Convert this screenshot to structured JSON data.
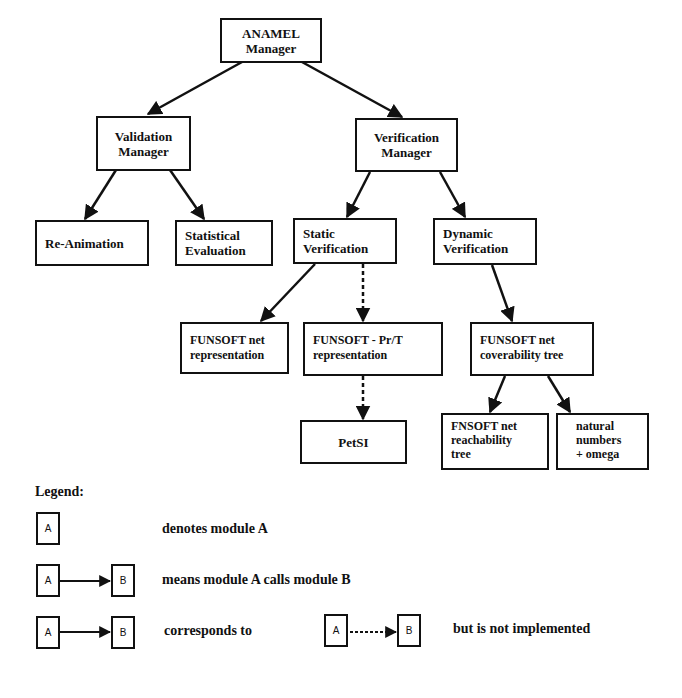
{
  "diagram": {
    "nodes": [
      {
        "id": "anamel_manager",
        "lines": [
          "ANAMEL",
          "Manager"
        ]
      },
      {
        "id": "validation_manager",
        "lines": [
          "Validation",
          "Manager"
        ]
      },
      {
        "id": "verification_manager",
        "lines": [
          "Verification",
          "Manager"
        ]
      },
      {
        "id": "re_animation",
        "lines": [
          "Re-Animation"
        ]
      },
      {
        "id": "statistical_evaluation",
        "lines": [
          "Statistical",
          "Evaluation"
        ]
      },
      {
        "id": "static_verification",
        "lines": [
          "Static",
          "Verification"
        ]
      },
      {
        "id": "dynamic_verification",
        "lines": [
          "Dynamic",
          "Verification"
        ]
      },
      {
        "id": "funsoft_net_representation",
        "lines": [
          "FUNSOFT net",
          "representation"
        ]
      },
      {
        "id": "funsoft_prt_representation",
        "lines": [
          "FUNSOFT - Pr/T",
          "representation"
        ]
      },
      {
        "id": "funsoft_net_coverability_tree",
        "lines": [
          "FUNSOFT net",
          "coverability tree"
        ]
      },
      {
        "id": "petsi",
        "lines": [
          "PetSI"
        ]
      },
      {
        "id": "fnsoft_net_reachability_tree",
        "lines": [
          "FNSOFT net",
          "reachability",
          "tree"
        ]
      },
      {
        "id": "natural_numbers_omega",
        "lines": [
          "natural",
          "numbers",
          "+ omega"
        ]
      }
    ],
    "edges": [
      {
        "from": "anamel_manager",
        "to": "validation_manager",
        "style": "solid"
      },
      {
        "from": "anamel_manager",
        "to": "verification_manager",
        "style": "solid"
      },
      {
        "from": "validation_manager",
        "to": "re_animation",
        "style": "solid"
      },
      {
        "from": "validation_manager",
        "to": "statistical_evaluation",
        "style": "solid"
      },
      {
        "from": "verification_manager",
        "to": "static_verification",
        "style": "solid"
      },
      {
        "from": "verification_manager",
        "to": "dynamic_verification",
        "style": "solid"
      },
      {
        "from": "static_verification",
        "to": "funsoft_net_representation",
        "style": "solid"
      },
      {
        "from": "static_verification",
        "to": "funsoft_prt_representation",
        "style": "dashed"
      },
      {
        "from": "funsoft_prt_representation",
        "to": "petsi",
        "style": "dashed"
      },
      {
        "from": "dynamic_verification",
        "to": "funsoft_net_coverability_tree",
        "style": "solid"
      },
      {
        "from": "funsoft_net_coverability_tree",
        "to": "fnsoft_net_reachability_tree",
        "style": "solid"
      },
      {
        "from": "funsoft_net_coverability_tree",
        "to": "natural_numbers_omega",
        "style": "solid"
      }
    ]
  },
  "legend": {
    "title": "Legend:",
    "box_a": "A",
    "box_b": "B",
    "row1_text": "denotes module A",
    "row2_text": "means module A calls module B",
    "row3_text_mid": "corresponds to",
    "row3_text_end": "but is not implemented"
  }
}
